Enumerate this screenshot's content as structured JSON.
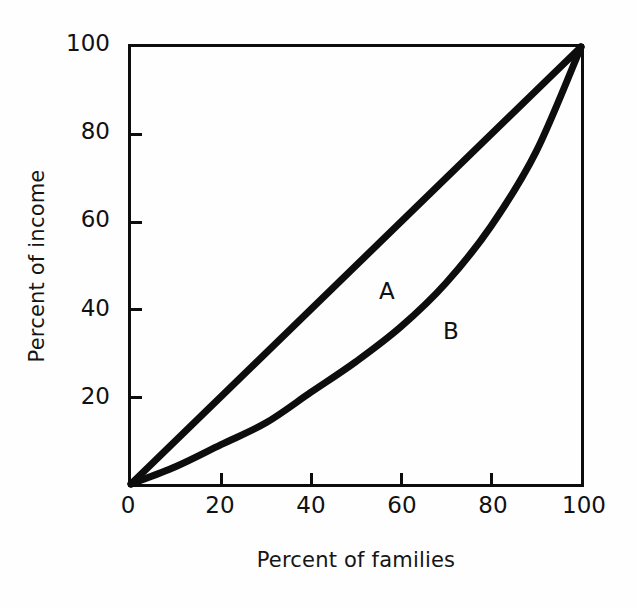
{
  "chart_data": {
    "type": "line",
    "title": "",
    "subtitle": "",
    "xlabel": "Percent of families",
    "ylabel": "Percent of income",
    "xlim": [
      0,
      100
    ],
    "ylim": [
      0,
      100
    ],
    "grid": false,
    "legend_position": "inline-annotation",
    "xticks": [
      {
        "value": 0,
        "label": "0"
      },
      {
        "value": 20,
        "label": "20"
      },
      {
        "value": 40,
        "label": "40"
      },
      {
        "value": 60,
        "label": "60"
      },
      {
        "value": 80,
        "label": "80"
      },
      {
        "value": 100,
        "label": "100"
      }
    ],
    "yticks": [
      {
        "value": 20,
        "label": "20"
      },
      {
        "value": 40,
        "label": "40"
      },
      {
        "value": 60,
        "label": "60"
      },
      {
        "value": 80,
        "label": "80"
      },
      {
        "value": 100,
        "label": "100"
      }
    ],
    "x": [
      0,
      10,
      20,
      30,
      40,
      50,
      60,
      70,
      80,
      90,
      100
    ],
    "series": [
      {
        "name": "A",
        "annotation": "A",
        "description": "line of perfect equality",
        "color": "#0d0d0d",
        "linewidth": 7,
        "values": [
          0,
          10,
          20,
          30,
          40,
          50,
          60,
          70,
          80,
          90,
          100
        ]
      },
      {
        "name": "B",
        "annotation": "B",
        "description": "Lorenz curve",
        "color": "#0d0d0d",
        "linewidth": 7,
        "values": [
          0,
          4,
          9,
          14,
          21,
          28,
          36,
          46,
          59,
          76,
          100
        ]
      }
    ],
    "annotations": [
      {
        "text": "A",
        "x": 56,
        "y": 47
      },
      {
        "text": "B",
        "x": 71,
        "y": 38
      }
    ],
    "style": {
      "background": "#fefefe",
      "axis_color": "#0d0d0d",
      "axis_linewidth": 3,
      "tick_direction": "in",
      "frame": "box"
    }
  }
}
